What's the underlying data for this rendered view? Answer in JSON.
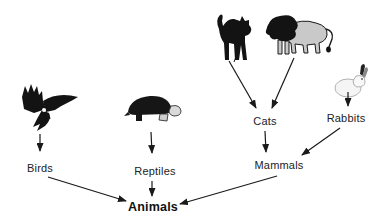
{
  "diagram": {
    "type": "hierarchy",
    "nodes": {
      "birds": {
        "label": "Birds"
      },
      "reptiles": {
        "label": "Reptiles"
      },
      "cats": {
        "label": "Cats"
      },
      "rabbits": {
        "label": "Rabbits"
      },
      "mammals": {
        "label": "Mammals"
      },
      "animals": {
        "label": "Animals"
      }
    },
    "images": [
      {
        "name": "eagle-image",
        "depicts": "flying eagle"
      },
      {
        "name": "turtle-image",
        "depicts": "turtle"
      },
      {
        "name": "cat-image",
        "depicts": "black cat with arched back"
      },
      {
        "name": "lion-image",
        "depicts": "lion"
      },
      {
        "name": "rabbit-image",
        "depicts": "white rabbit"
      }
    ],
    "edges": [
      {
        "from": "eagle-image",
        "to": "birds",
        "x1": 40,
        "y1": 134,
        "x2": 40,
        "y2": 151
      },
      {
        "from": "turtle-image",
        "to": "reptiles",
        "x1": 151,
        "y1": 132,
        "x2": 152,
        "y2": 153
      },
      {
        "from": "cat-image",
        "to": "cats",
        "x1": 229,
        "y1": 61,
        "x2": 256,
        "y2": 108
      },
      {
        "from": "lion-image",
        "to": "cats",
        "x1": 294,
        "y1": 58,
        "x2": 272,
        "y2": 108
      },
      {
        "from": "rabbit-image",
        "to": "rabbits",
        "x1": 348,
        "y1": 92,
        "x2": 348,
        "y2": 106
      },
      {
        "from": "cats",
        "to": "mammals",
        "x1": 265,
        "y1": 131,
        "x2": 266,
        "y2": 152
      },
      {
        "from": "rabbits",
        "to": "mammals",
        "x1": 340,
        "y1": 128,
        "x2": 302,
        "y2": 155
      },
      {
        "from": "birds",
        "to": "animals",
        "x1": 48,
        "y1": 177,
        "x2": 126,
        "y2": 201
      },
      {
        "from": "reptiles",
        "to": "animals",
        "x1": 152,
        "y1": 181,
        "x2": 152,
        "y2": 196
      },
      {
        "from": "mammals",
        "to": "animals",
        "x1": 277,
        "y1": 176,
        "x2": 180,
        "y2": 204
      }
    ],
    "colors": {
      "background": "#ffffff",
      "arrow": "#1a1a1a",
      "text": "#222222",
      "silhouette": "#131313",
      "lion_body": "#c9c9c9",
      "rabbit_body": "#f5f5f5"
    }
  }
}
